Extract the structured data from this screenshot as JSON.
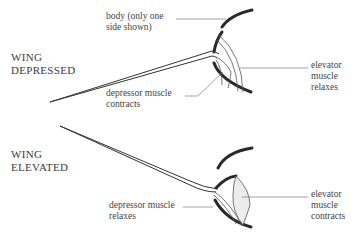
{
  "figure": {
    "panels": [
      {
        "title_line1": "WING",
        "title_line2": "DEPRESSED",
        "labels": {
          "body_line1": "body (only one",
          "body_line2": "side shown)",
          "depressor_line1": "depressor muscle",
          "depressor_line2": "contracts",
          "elevator_line1": "elevator",
          "elevator_line2": "muscle",
          "elevator_line3": "relaxes"
        }
      },
      {
        "title_line1": "WING",
        "title_line2": "ELEVATED",
        "labels": {
          "depressor_line1": "depressor muscle",
          "depressor_line2": "relaxes",
          "elevator_line1": "elevator",
          "elevator_line2": "muscle",
          "elevator_line3": "contracts"
        }
      }
    ]
  }
}
